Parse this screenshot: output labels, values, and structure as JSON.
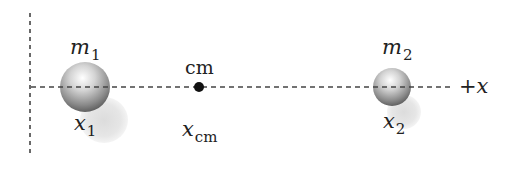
{
  "diagram": {
    "title": "",
    "axis": {
      "label": "+x",
      "orientation": "horizontal",
      "style": "dashed"
    },
    "vertical_reference": {
      "style": "dashed"
    },
    "masses": [
      {
        "id": "m1",
        "symbol": "m",
        "subscript": "1",
        "position_symbol": "x",
        "position_subscript": "1",
        "relative_size": "large"
      },
      {
        "id": "m2",
        "symbol": "m",
        "subscript": "2",
        "position_symbol": "x",
        "position_subscript": "2",
        "relative_size": "small"
      }
    ],
    "center_of_mass": {
      "label": "cm",
      "position_symbol": "x",
      "position_subscript": "cm"
    }
  },
  "colors": {
    "axis": "#444444",
    "sphere_highlight": "#ffffff",
    "sphere_mid": "#b0b0b0",
    "sphere_dark": "#5a5a5a",
    "shadow": "#e2e2e2",
    "cm_dot": "#111111",
    "text": "#222222"
  }
}
